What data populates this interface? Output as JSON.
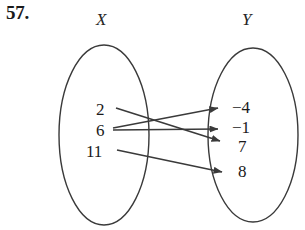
{
  "problem": {
    "number": "57."
  },
  "sets": {
    "domain": {
      "label": "X",
      "elements": [
        {
          "value": "2",
          "x": 96,
          "y": 101
        },
        {
          "value": "6",
          "x": 96,
          "y": 122
        },
        {
          "value": "11",
          "x": 86,
          "y": 143
        }
      ]
    },
    "range": {
      "label": "Y",
      "elements": [
        {
          "value": "−4",
          "x": 232,
          "y": 99
        },
        {
          "value": "−1",
          "x": 232,
          "y": 119
        },
        {
          "value": "7",
          "x": 238,
          "y": 138
        },
        {
          "value": "8",
          "x": 238,
          "y": 163
        }
      ]
    }
  },
  "mappings": [
    {
      "from": "2",
      "to": "7",
      "x1": 116,
      "y1": 108,
      "x2": 220,
      "y2": 141
    },
    {
      "from": "6",
      "to": "−4",
      "x1": 113,
      "y1": 128,
      "x2": 218,
      "y2": 108
    },
    {
      "from": "6",
      "to": "−1",
      "x1": 113,
      "y1": 130,
      "x2": 218,
      "y2": 129
    },
    {
      "from": "11",
      "to": "8",
      "x1": 117,
      "y1": 150,
      "x2": 222,
      "y2": 172
    }
  ],
  "shapes": {
    "left_ellipse": {
      "cx": 104,
      "cy": 135,
      "rx": 45,
      "ry": 90
    },
    "right_ellipse": {
      "cx": 253,
      "cy": 135,
      "rx": 45,
      "ry": 87
    }
  },
  "style": {
    "stroke_color": "#3a3a3a",
    "background_color": "#ffffff",
    "text_color": "#1a1a1a"
  }
}
